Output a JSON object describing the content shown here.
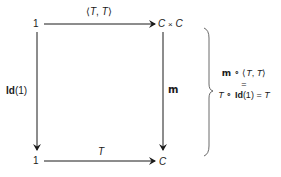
{
  "diagram": {
    "type": "commutative-square",
    "nodes": {
      "top_left": "1",
      "top_right_a": "C",
      "top_right_times": "×",
      "top_right_b": "C",
      "bottom_left": "1",
      "bottom_right": "C"
    },
    "edges": {
      "top": {
        "label_open": "⟨",
        "label_a": "T",
        "label_sep": ", ",
        "label_b": "T",
        "label_close": "⟩"
      },
      "left": {
        "label_bold": "Id",
        "label_rest": "(1)"
      },
      "right": {
        "label": "m"
      },
      "bottom": {
        "label": "T"
      }
    },
    "equation": {
      "line1": {
        "m": "m",
        "compose": " ∘ ",
        "open": "⟨",
        "a": "T",
        "sep": ", ",
        "b": "T",
        "close": "⟩"
      },
      "line2": "=",
      "line3": {
        "a": "T",
        "compose": " ∘ ",
        "id": "Id",
        "arg": "(1)",
        "eq": " = ",
        "b": "T"
      }
    },
    "colors": {
      "ink": "#1a1a1a",
      "background": "#ffffff"
    }
  }
}
